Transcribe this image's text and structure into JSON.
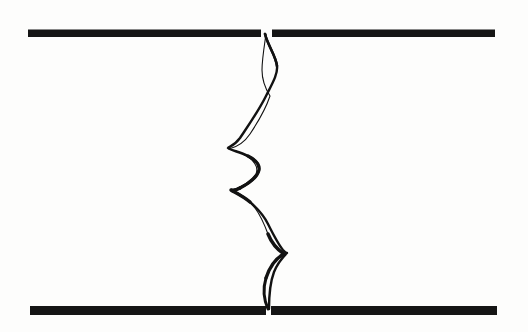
{
  "figure": {
    "canvas": {
      "width": 528,
      "height": 332
    },
    "colors": {
      "background": "#fdfdfc",
      "ink": "#121212",
      "bar_fill": "#151515"
    }
  },
  "bars": [
    {
      "name": "top-bar-left",
      "x": 28,
      "y": 29.5,
      "width": 233,
      "height": 7.5,
      "label": "upper bar, left segment"
    },
    {
      "name": "top-bar-right",
      "x": 272,
      "y": 29.5,
      "width": 223,
      "height": 7.5,
      "label": "upper bar, right segment"
    },
    {
      "name": "bottom-bar-left",
      "x": 30,
      "y": 306,
      "width": 236,
      "height": 9,
      "label": "lower bar, left segment"
    },
    {
      "name": "bottom-bar-right",
      "x": 271,
      "y": 306,
      "width": 226,
      "height": 9,
      "label": "lower bar, right segment"
    }
  ],
  "gaps": [
    {
      "name": "top-gap",
      "x_start": 261,
      "x_end": 272,
      "y": 33
    },
    {
      "name": "bottom-gap",
      "x_start": 266,
      "x_end": 271,
      "y": 310
    }
  ],
  "crack": {
    "name": "fracture-seam",
    "top_anchor": {
      "x": 265,
      "y": 34
    },
    "bottom_anchor": {
      "x": 269,
      "y": 309
    },
    "cusps": [
      {
        "name": "cusp-upper-right",
        "x": 278,
        "y": 70,
        "direction": "right"
      },
      {
        "name": "cusp-left-upper",
        "x": 228,
        "y": 148,
        "direction": "left"
      },
      {
        "name": "cusp-right-mid",
        "x": 259,
        "y": 158,
        "direction": "right"
      },
      {
        "name": "cusp-left-mid",
        "x": 231,
        "y": 190,
        "direction": "left"
      },
      {
        "name": "cusp-right-lower",
        "x": 287,
        "y": 253,
        "direction": "right"
      }
    ],
    "paths": {
      "strand_a": "M265,34 C268,46 276,56 277,66 C278,74 272,84 266,96 C258,112 248,126 240,138 C234,146 229,147 228,148 C230,150 240,152 248,156 C256,160 260,164 259,170 C257,178 248,184 240,188 C235,191 232,190 231,190 C234,192 243,196 250,202 C258,209 264,216 268,224 C273,234 278,244 283,250 C286,253 287,253 287,253 C284,256 278,262 274,272 C271,280 269,294 269,309",
      "strand_b": "M266,34 C264,48 262,60 262,70 C262,80 265,88 270,96 C266,108 258,122 250,134 C244,143 237,147 229,149 C238,151 246,155 252,160 C257,165 258,169 256,174 C250,182 243,186 233,190 C241,194 249,200 255,208 C261,216 265,226 268,234 C272,244 278,250 284,254 C276,258 270,266 266,278 C263,288 264,300 268,309"
    },
    "stroke_widths": {
      "thin": 1.0,
      "medium": 1.8,
      "thick": 3.2
    },
    "lens_voids": [
      {
        "name": "lens-top",
        "top_y": 36,
        "bottom_y": 96,
        "max_width": 13
      },
      {
        "name": "lens-upper-mid",
        "top_y": 100,
        "bottom_y": 150,
        "max_width": 20
      },
      {
        "name": "lens-mid",
        "top_y": 150,
        "bottom_y": 192,
        "max_width": 24
      },
      {
        "name": "lens-lower",
        "top_y": 194,
        "bottom_y": 256,
        "max_width": 26
      },
      {
        "name": "lens-bottom",
        "top_y": 256,
        "bottom_y": 309,
        "max_width": 18
      }
    ]
  }
}
